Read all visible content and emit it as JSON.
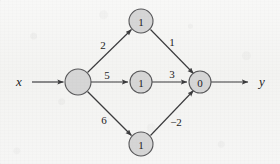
{
  "figure": {
    "colors": {
      "node_fill": "#d6d6d6",
      "node_stroke": "#58585a",
      "edge_stroke": "#3b3b3d",
      "background": "#f5f5f3",
      "text": "#1d1d1f"
    },
    "input_label": "x",
    "output_label": "y",
    "nodes": [
      {
        "id": "hub",
        "label": "",
        "cx": 78,
        "cy": 82,
        "r": 13
      },
      {
        "id": "top",
        "label": "1",
        "cx": 141,
        "cy": 21,
        "r": 12
      },
      {
        "id": "middle",
        "label": "1",
        "cx": 141,
        "cy": 82,
        "r": 11
      },
      {
        "id": "bottom",
        "label": "1",
        "cx": 141,
        "cy": 144,
        "r": 12
      },
      {
        "id": "out",
        "label": "0",
        "cx": 200,
        "cy": 82,
        "r": 11
      }
    ],
    "edges": [
      {
        "id": "x-to-hub",
        "from": "input",
        "to": "hub",
        "weight": ""
      },
      {
        "id": "hub-to-top",
        "from": "hub",
        "to": "top",
        "weight": "2"
      },
      {
        "id": "hub-to-middle",
        "from": "hub",
        "to": "middle",
        "weight": "5"
      },
      {
        "id": "hub-to-bottom",
        "from": "hub",
        "to": "bottom",
        "weight": "6"
      },
      {
        "id": "top-to-out",
        "from": "top",
        "to": "out",
        "weight": "1"
      },
      {
        "id": "middle-to-out",
        "from": "middle",
        "to": "out",
        "weight": "3"
      },
      {
        "id": "bottom-to-out",
        "from": "bottom",
        "to": "out",
        "weight": "−2"
      },
      {
        "id": "out-to-y",
        "from": "out",
        "to": "output",
        "weight": ""
      }
    ],
    "edge_label_positions": {
      "hub_top": {
        "x": 103,
        "y": 45
      },
      "hub_middle": {
        "x": 107,
        "y": 75
      },
      "hub_bottom": {
        "x": 104,
        "y": 120
      },
      "top_out": {
        "x": 172,
        "y": 42
      },
      "middle_out": {
        "x": 172,
        "y": 74
      },
      "bottom_out": {
        "x": 176,
        "y": 122
      }
    },
    "io_label_positions": {
      "input": {
        "x": 19,
        "y": 81
      },
      "output": {
        "x": 262,
        "y": 81
      }
    }
  }
}
